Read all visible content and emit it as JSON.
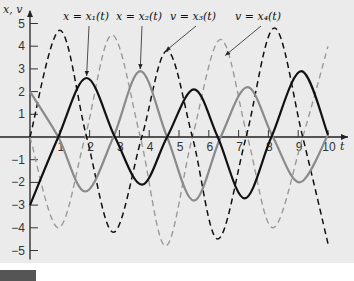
{
  "chart_data": {
    "type": "line",
    "title": "",
    "xlabel": "t",
    "ylabel": "x, v",
    "xlim": [
      0,
      10.5
    ],
    "ylim": [
      -5.4,
      5.6
    ],
    "x_ticks": [
      1,
      2,
      3,
      4,
      5,
      6,
      7,
      8,
      9,
      10
    ],
    "y_ticks": [
      -5,
      -4,
      -3,
      -2,
      -1,
      1,
      2,
      3,
      4,
      5
    ],
    "grid": false,
    "legend": "annotations",
    "series": [
      {
        "name": "x = x1(t)",
        "style": "solid",
        "color": "#111111",
        "width": 2.2,
        "points": [
          [
            0,
            -3
          ],
          [
            0.95,
            0
          ],
          [
            1.9,
            2.6
          ],
          [
            2.85,
            0
          ],
          [
            3.75,
            -2.1
          ],
          [
            4.6,
            0
          ],
          [
            5.5,
            2.1
          ],
          [
            6.3,
            0
          ],
          [
            7.2,
            -2.7
          ],
          [
            8.1,
            0
          ],
          [
            9.1,
            2.9
          ],
          [
            10,
            0.1
          ]
        ]
      },
      {
        "name": "x = x2(t)",
        "style": "solid",
        "color": "#8a8a8a",
        "width": 2.2,
        "points": [
          [
            0,
            2
          ],
          [
            0.95,
            0
          ],
          [
            1.85,
            -2.4
          ],
          [
            2.8,
            0
          ],
          [
            3.7,
            2.9
          ],
          [
            4.6,
            0
          ],
          [
            5.5,
            -2.8
          ],
          [
            6.4,
            0
          ],
          [
            7.3,
            2.2
          ],
          [
            8.15,
            0
          ],
          [
            9.05,
            -2.0
          ],
          [
            10,
            0.1
          ]
        ]
      },
      {
        "name": "v = x3(t)",
        "style": "dashed",
        "color": "#111111",
        "width": 1.5,
        "points": [
          [
            0,
            0
          ],
          [
            1.0,
            4.7
          ],
          [
            1.9,
            0
          ],
          [
            2.8,
            -4.2
          ],
          [
            3.75,
            0
          ],
          [
            4.6,
            3.8
          ],
          [
            5.45,
            0
          ],
          [
            6.3,
            -4.5
          ],
          [
            7.25,
            0
          ],
          [
            8.2,
            4.8
          ],
          [
            9.15,
            0
          ],
          [
            10,
            -4.7
          ]
        ]
      },
      {
        "name": "v = x4(t)",
        "style": "dashed",
        "color": "#9a9a9a",
        "width": 1.4,
        "points": [
          [
            0,
            0
          ],
          [
            0.95,
            -4.0
          ],
          [
            1.85,
            0
          ],
          [
            2.75,
            4.5
          ],
          [
            3.7,
            0
          ],
          [
            4.55,
            -4.8
          ],
          [
            5.45,
            0
          ],
          [
            6.4,
            4.3
          ],
          [
            7.3,
            0
          ],
          [
            8.15,
            -4.0
          ],
          [
            9.15,
            0
          ],
          [
            10,
            4.0
          ]
        ]
      }
    ],
    "annotations": [
      {
        "text": "x = x₁(t)",
        "label_x": 63,
        "label_y": 20,
        "target_t": 1.9,
        "target_v": 2.6
      },
      {
        "text": "x = x₂(t)",
        "label_x": 116,
        "label_y": 20,
        "target_t": 3.7,
        "target_v": 2.9
      },
      {
        "text": "v = x₃(t)",
        "label_x": 170,
        "label_y": 20,
        "target_t": 4.55,
        "target_v": 3.7
      },
      {
        "text": "v = x₄(t)",
        "label_x": 235,
        "label_y": 20,
        "target_t": 6.55,
        "target_v": 3.5
      }
    ]
  },
  "labels": {
    "y_axis": "x, v",
    "x_axis": "t"
  }
}
